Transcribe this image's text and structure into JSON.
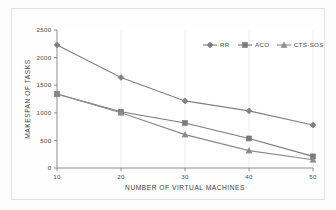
{
  "chart_data": {
    "type": "line",
    "title": "",
    "xlabel": "NUMBER OF VIRTUAL MACHINES",
    "ylabel": "MAKESPAN  OF  TASKS",
    "x": [
      10,
      20,
      30,
      40,
      50
    ],
    "xticklabels": [
      "10",
      "20",
      "30",
      "40",
      "50"
    ],
    "yticklabels": [
      "0",
      "500",
      "1000",
      "1500",
      "2000",
      "2500"
    ],
    "yticks": [
      0,
      500,
      1000,
      1500,
      2000,
      2500
    ],
    "xlim": [
      10,
      50
    ],
    "ylim": [
      0,
      2500
    ],
    "grid": false,
    "legend_position": "top-right",
    "series": [
      {
        "name": "RR",
        "marker": "diamond",
        "color": "#808080",
        "values": [
          2230,
          1640,
          1215,
          1035,
          780
        ]
      },
      {
        "name": "ACO",
        "marker": "square",
        "color": "#7a7a7a",
        "values": [
          1340,
          1020,
          815,
          535,
          210
        ]
      },
      {
        "name": "CTS-SOS",
        "marker": "triangle",
        "color": "#8a8a8a",
        "values": [
          1340,
          1000,
          605,
          315,
          150
        ]
      }
    ]
  },
  "legend": {
    "items": [
      {
        "label": "RR",
        "marker": "diamond-marker"
      },
      {
        "label": "ACO",
        "marker": "square-marker"
      },
      {
        "label": "CTS-SOS",
        "marker": "triangle-marker"
      }
    ]
  }
}
